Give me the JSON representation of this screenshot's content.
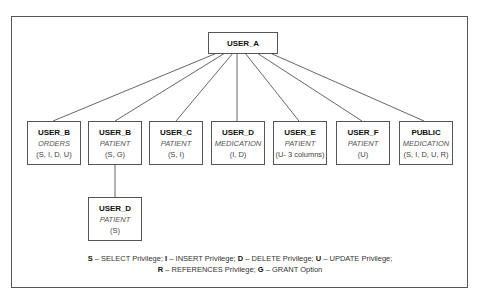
{
  "diagram": {
    "root": {
      "name": "USER_A"
    },
    "children": [
      {
        "name": "USER_B",
        "object": "ORDERS",
        "privileges": "(S, I, D, U)"
      },
      {
        "name": "USER_B",
        "object": "PATIENT",
        "privileges": "(S, G)"
      },
      {
        "name": "USER_C",
        "object": "PATIENT",
        "privileges": "(S, I)"
      },
      {
        "name": "USER_D",
        "object": "MEDICATION",
        "privileges": "(I, D)"
      },
      {
        "name": "USER_E",
        "object": "PATIENT",
        "privileges": "(U- 3 columns)"
      },
      {
        "name": "USER_F",
        "object": "PATIENT",
        "privileges": "(U)"
      },
      {
        "name": "PUBLIC",
        "object": "MEDICATION",
        "privileges": "(S, I, D, U, R)"
      }
    ],
    "grandchild": {
      "parent_index": 1,
      "name": "USER_D",
      "object": "PATIENT",
      "privileges": "(S)"
    },
    "legend": {
      "line1": [
        {
          "key": "S",
          "text": " – SELECT Privilege; "
        },
        {
          "key": "I",
          "text": " – INSERT Privilege; "
        },
        {
          "key": "D",
          "text": " – DELETE Privilege; "
        },
        {
          "key": "U",
          "text": " – UPDATE Privilege;"
        }
      ],
      "line2": [
        {
          "key": "R",
          "text": " – REFERENCES Privilege; "
        },
        {
          "key": "G",
          "text": " – GRANT Option"
        }
      ]
    }
  }
}
